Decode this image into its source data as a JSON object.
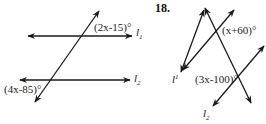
{
  "figure_left": {
    "angle_top": "(2x-15)°",
    "angle_bottom": "(4x-85)°",
    "line_top_label": "l",
    "line_top_sub": "1",
    "line_bottom_label": "l",
    "line_bottom_sub": "2"
  },
  "figure_right": {
    "problem_number": "18.",
    "angle_top": "(x+60)°",
    "angle_bottom": "(3x-100)°",
    "line_left_label": "l",
    "line_left_sub": "1",
    "line_bottom_label": "l",
    "line_bottom_sub": "2"
  },
  "colors": {
    "ink": "#1a1a1a",
    "background": "#ffffff"
  }
}
